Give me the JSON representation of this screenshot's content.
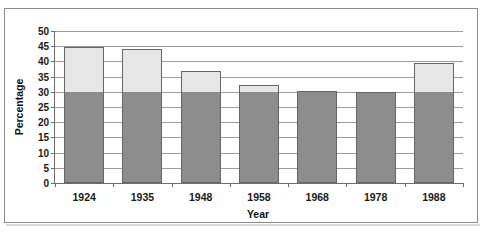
{
  "figure": {
    "top_edge_remnant": "",
    "background_color": "#ffffff",
    "frame_border_color": "#8c8c8c"
  },
  "chart_data": {
    "type": "bar",
    "subtype": "stacked-bar",
    "title": "",
    "xlabel": "Year",
    "ylabel": "Percentage",
    "categories": [
      "1924",
      "1935",
      "1948",
      "1958",
      "1968",
      "1978",
      "1988"
    ],
    "series": [
      {
        "name": "lower-segment",
        "color": "#8d8d8d",
        "values": [
          30.0,
          30.0,
          30.0,
          30.0,
          30.2,
          29.8,
          30.0
        ]
      },
      {
        "name": "upper-segment",
        "color": "#e6e6e6",
        "values": [
          14.7,
          14.0,
          7.0,
          2.3,
          0.0,
          0.0,
          9.5
        ]
      }
    ],
    "totals": [
      44.7,
      44.0,
      37.0,
      32.3,
      30.2,
      29.8,
      39.5
    ],
    "ylim": [
      0,
      50
    ],
    "ytick_step": 5,
    "ytick_labels": [
      "0",
      "5",
      "10",
      "15",
      "20",
      "25",
      "30",
      "35",
      "40",
      "45",
      "50"
    ],
    "grid": true,
    "grid_axis": "y",
    "legend": false,
    "legend_position": "none",
    "bar_border_color": "#666666",
    "gridline_color": "#9d9d9d",
    "axis_color": "#6e6e6e"
  }
}
